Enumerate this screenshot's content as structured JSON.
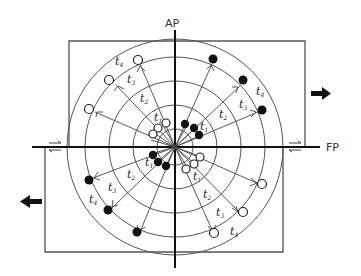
{
  "diagram": {
    "axes": {
      "vertical_label": "AP",
      "horizontal_label": "FP"
    },
    "time_labels": [
      "t1",
      "t2",
      "t3",
      "t4"
    ],
    "time_glyph": "t",
    "legend_markers": {
      "open_circle": "open",
      "filled_circle": "filled"
    },
    "arrows": {
      "right": "move-right",
      "left": "move-left"
    },
    "colors": {
      "ink": "#1a1a1a",
      "line": "#555555",
      "background": "#ffffff"
    },
    "center": [
      175,
      147
    ],
    "ring_radii": [
      18,
      42,
      66,
      90,
      108
    ]
  }
}
